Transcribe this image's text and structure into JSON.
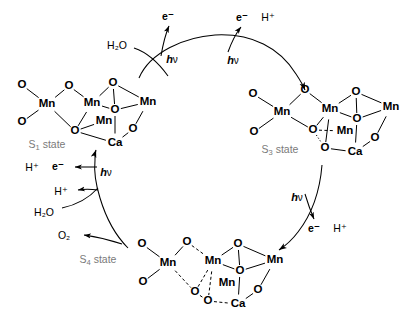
{
  "figure": {
    "type": "reaction-cycle-diagram",
    "background_color": "#ffffff",
    "line_color": "#000000",
    "state_label_color": "#7a7a7a"
  },
  "states": [
    {
      "id": "s1",
      "label": "S",
      "sub": "1",
      "suffix": " state",
      "label_x": 47,
      "label_y": 145,
      "atoms": [
        {
          "name": "O",
          "el": "O",
          "x": 22,
          "y": 85
        },
        {
          "name": "O",
          "el": "O",
          "x": 22,
          "y": 122
        },
        {
          "name": "Mn",
          "el": "Mn",
          "x": 47,
          "y": 104
        },
        {
          "name": "O",
          "el": "O",
          "x": 69,
          "y": 86
        },
        {
          "name": "Mn",
          "el": "Mn",
          "x": 92,
          "y": 103
        },
        {
          "name": "O",
          "el": "O",
          "x": 75,
          "y": 131
        },
        {
          "name": "O",
          "el": "O",
          "x": 113,
          "y": 83
        },
        {
          "name": "Mn",
          "el": "Mn",
          "x": 148,
          "y": 102
        },
        {
          "name": "O",
          "el": "O",
          "x": 115,
          "y": 110
        },
        {
          "name": "Mn",
          "el": "Mn",
          "x": 104,
          "y": 121
        },
        {
          "name": "O",
          "el": "O",
          "x": 133,
          "y": 129
        },
        {
          "name": "Ca",
          "el": "Ca",
          "x": 115,
          "y": 143
        }
      ],
      "bonds": [
        {
          "a": 0,
          "b": 2,
          "style": "solid"
        },
        {
          "a": 1,
          "b": 2,
          "style": "solid"
        },
        {
          "a": 2,
          "b": 3,
          "style": "solid"
        },
        {
          "a": 3,
          "b": 4,
          "style": "solid"
        },
        {
          "a": 2,
          "b": 5,
          "style": "solid"
        },
        {
          "a": 4,
          "b": 5,
          "style": "solid"
        },
        {
          "a": 4,
          "b": 6,
          "style": "solid"
        },
        {
          "a": 6,
          "b": 7,
          "style": "solid"
        },
        {
          "a": 4,
          "b": 8,
          "style": "solid"
        },
        {
          "a": 8,
          "b": 7,
          "style": "solid"
        },
        {
          "a": 5,
          "b": 11,
          "style": "solid"
        },
        {
          "a": 11,
          "b": 10,
          "style": "solid"
        },
        {
          "a": 10,
          "b": 7,
          "style": "solid"
        },
        {
          "a": 8,
          "b": 11,
          "style": "solid"
        },
        {
          "a": 6,
          "b": 8,
          "style": "solid"
        },
        {
          "a": 5,
          "b": 9,
          "style": "solid"
        }
      ]
    },
    {
      "id": "s3",
      "label": "S",
      "sub": "3",
      "suffix": " state",
      "label_x": 280,
      "label_y": 150,
      "atoms": [
        {
          "name": "O",
          "el": "O",
          "x": 253,
          "y": 94
        },
        {
          "name": "O",
          "el": "O",
          "x": 254,
          "y": 132
        },
        {
          "name": "Mn",
          "el": "Mn",
          "x": 282,
          "y": 112
        },
        {
          "name": "O",
          "el": "O",
          "x": 305,
          "y": 90
        },
        {
          "name": "Mn",
          "el": "Mn",
          "x": 330,
          "y": 109
        },
        {
          "name": "O",
          "el": "O",
          "x": 313,
          "y": 130
        },
        {
          "name": "O",
          "el": "O",
          "x": 356,
          "y": 92
        },
        {
          "name": "Mn",
          "el": "Mn",
          "x": 391,
          "y": 107
        },
        {
          "name": "O",
          "el": "O",
          "x": 357,
          "y": 119
        },
        {
          "name": "Mn",
          "el": "Mn",
          "x": 345,
          "y": 131
        },
        {
          "name": "O",
          "el": "O",
          "x": 375,
          "y": 138
        },
        {
          "name": "Ca",
          "el": "Ca",
          "x": 355,
          "y": 152
        },
        {
          "name": "O",
          "el": "O",
          "x": 325,
          "y": 148
        }
      ],
      "bonds": [
        {
          "a": 0,
          "b": 2,
          "style": "solid"
        },
        {
          "a": 1,
          "b": 2,
          "style": "solid"
        },
        {
          "a": 2,
          "b": 3,
          "style": "solid"
        },
        {
          "a": 3,
          "b": 4,
          "style": "solid"
        },
        {
          "a": 2,
          "b": 5,
          "style": "solid"
        },
        {
          "a": 4,
          "b": 5,
          "style": "solid"
        },
        {
          "a": 4,
          "b": 6,
          "style": "solid"
        },
        {
          "a": 6,
          "b": 7,
          "style": "solid"
        },
        {
          "a": 4,
          "b": 8,
          "style": "solid"
        },
        {
          "a": 8,
          "b": 7,
          "style": "solid"
        },
        {
          "a": 6,
          "b": 8,
          "style": "solid"
        },
        {
          "a": 8,
          "b": 11,
          "style": "solid"
        },
        {
          "a": 11,
          "b": 10,
          "style": "solid"
        },
        {
          "a": 10,
          "b": 7,
          "style": "solid"
        },
        {
          "a": 4,
          "b": 12,
          "style": "solid"
        },
        {
          "a": 12,
          "b": 11,
          "style": "solid"
        },
        {
          "a": 5,
          "b": 12,
          "style": "dotted"
        },
        {
          "a": 5,
          "b": 9,
          "style": "dashed"
        }
      ]
    },
    {
      "id": "s4",
      "label": "S",
      "sub": "4",
      "suffix": " state",
      "label_x": 98,
      "label_y": 260,
      "atoms": [
        {
          "name": "O",
          "el": "O",
          "x": 142,
          "y": 244
        },
        {
          "name": "O",
          "el": "O",
          "x": 143,
          "y": 282
        },
        {
          "name": "Mn",
          "el": "Mn",
          "x": 168,
          "y": 263
        },
        {
          "name": "O",
          "el": "O",
          "x": 187,
          "y": 242
        },
        {
          "name": "Mn",
          "el": "Mn",
          "x": 213,
          "y": 261
        },
        {
          "name": "O",
          "el": "O",
          "x": 195,
          "y": 292
        },
        {
          "name": "O",
          "el": "O",
          "x": 238,
          "y": 244
        },
        {
          "name": "Mn",
          "el": "Mn",
          "x": 275,
          "y": 260
        },
        {
          "name": "O",
          "el": "O",
          "x": 240,
          "y": 271
        },
        {
          "name": "Mn",
          "el": "Mn",
          "x": 227,
          "y": 283
        },
        {
          "name": "O",
          "el": "O",
          "x": 258,
          "y": 290
        },
        {
          "name": "Ca",
          "el": "Ca",
          "x": 238,
          "y": 304
        },
        {
          "name": "O",
          "el": "O",
          "x": 208,
          "y": 301
        }
      ],
      "bonds": [
        {
          "a": 0,
          "b": 2,
          "style": "solid"
        },
        {
          "a": 1,
          "b": 2,
          "style": "solid"
        },
        {
          "a": 2,
          "b": 3,
          "style": "solid"
        },
        {
          "a": 3,
          "b": 4,
          "style": "dashed"
        },
        {
          "a": 2,
          "b": 5,
          "style": "dashed"
        },
        {
          "a": 4,
          "b": 5,
          "style": "dashed"
        },
        {
          "a": 4,
          "b": 6,
          "style": "solid"
        },
        {
          "a": 6,
          "b": 7,
          "style": "solid"
        },
        {
          "a": 4,
          "b": 8,
          "style": "solid"
        },
        {
          "a": 8,
          "b": 7,
          "style": "solid"
        },
        {
          "a": 6,
          "b": 8,
          "style": "solid"
        },
        {
          "a": 8,
          "b": 11,
          "style": "solid"
        },
        {
          "a": 11,
          "b": 10,
          "style": "solid"
        },
        {
          "a": 10,
          "b": 7,
          "style": "solid"
        },
        {
          "a": 4,
          "b": 12,
          "style": "dashed"
        },
        {
          "a": 12,
          "b": 11,
          "style": "dashed"
        },
        {
          "a": 5,
          "b": 12,
          "style": "dashed"
        }
      ]
    }
  ],
  "annotations": [
    {
      "id": "h2o-top",
      "text": "H₂O",
      "x": 117,
      "y": 45,
      "bold": false
    },
    {
      "id": "e-top1",
      "text": "e⁻",
      "x": 168,
      "y": 16,
      "bold": true
    },
    {
      "id": "hv-top1",
      "text": "hν",
      "x": 172,
      "y": 59,
      "bold": true
    },
    {
      "id": "e-top2",
      "text": "e⁻",
      "x": 242,
      "y": 17,
      "bold": true
    },
    {
      "id": "hplus-top2",
      "text": "H⁺",
      "x": 268,
      "y": 17,
      "bold": false
    },
    {
      "id": "hv-top2",
      "text": "hν",
      "x": 233,
      "y": 60,
      "bold": true
    },
    {
      "id": "hv-right",
      "text": "hν",
      "x": 297,
      "y": 197,
      "bold": true
    },
    {
      "id": "e-right",
      "text": "e⁻",
      "x": 314,
      "y": 228,
      "bold": true
    },
    {
      "id": "hplus-right",
      "text": "H⁺",
      "x": 340,
      "y": 228,
      "bold": false
    },
    {
      "id": "hplus-l1",
      "text": "H⁺",
      "x": 32,
      "y": 167,
      "bold": false
    },
    {
      "id": "e-left",
      "text": "e⁻",
      "x": 58,
      "y": 166,
      "bold": true
    },
    {
      "id": "hv-left",
      "text": "hν",
      "x": 106,
      "y": 172,
      "bold": true
    },
    {
      "id": "hplus-l2",
      "text": "H⁺",
      "x": 61,
      "y": 191,
      "bold": false
    },
    {
      "id": "h2o-left",
      "text": "H₂O",
      "x": 44,
      "y": 212,
      "bold": false
    },
    {
      "id": "o2-left",
      "text": "O₂",
      "x": 64,
      "y": 235,
      "bold": false
    }
  ],
  "arrows": [
    {
      "id": "arc-s1-to-top",
      "desc": "cycle arc rising from S1 cluster toward top"
    },
    {
      "id": "arrow-h2o-in",
      "desc": "H2O feeds into first photon step"
    },
    {
      "id": "arrow-e-out-1",
      "desc": "electron released at first hv step"
    },
    {
      "id": "arrow-e-h-out-2",
      "desc": "electron and proton released at second hv step"
    },
    {
      "id": "arc-top-to-s3",
      "desc": "cycle arc descending to S3 cluster"
    },
    {
      "id": "arc-s3-to-s4",
      "desc": "cycle arc descending from S3 to S4 cluster"
    },
    {
      "id": "arrow-e-h-out-3",
      "desc": "electron and proton released at third hv step"
    },
    {
      "id": "arc-s4-to-s1",
      "desc": "cycle arc rising from S4 cluster back to S1"
    },
    {
      "id": "arrow-o2-out",
      "desc": "O2 released"
    },
    {
      "id": "arrow-h2o-in-left",
      "desc": "H2O enters on the left branch"
    },
    {
      "id": "arrow-h-out-left",
      "desc": "proton released on the left branch"
    },
    {
      "id": "arrow-e-h-out-left",
      "desc": "electron and proton released at fourth hv step"
    }
  ]
}
